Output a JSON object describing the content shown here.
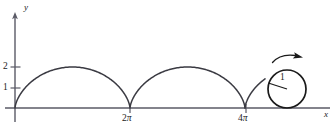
{
  "figure": {
    "kind": "cycloid-diagram",
    "colors": {
      "axis": "#5a5a66",
      "curve": "#3a3a42",
      "text": "#1a1a1a",
      "background": "#ffffff"
    },
    "axes": {
      "x_label": "x",
      "y_label": "y",
      "origin_px": {
        "x": 15,
        "y": 108
      },
      "x_axis_end_px": 330,
      "y_axis_top_px": 14
    },
    "y_ticks": [
      {
        "label": "1",
        "value": 1,
        "y_px": 88
      },
      {
        "label": "2",
        "value": 2,
        "y_px": 67
      }
    ],
    "x_ticks": [
      {
        "label_number": "2",
        "label_symbol": "π",
        "value": 6.2832,
        "x_px": 130
      },
      {
        "label_number": "4",
        "label_symbol": "π",
        "value": 12.5664,
        "x_px": 246
      }
    ],
    "circle": {
      "radius_label": "1",
      "center_px": {
        "x": 287,
        "y": 89
      },
      "radius_px": 19,
      "spoke_end_px": {
        "x": 268,
        "y": 83
      }
    },
    "rotation_arrow": {
      "label": "",
      "direction": "clockwise",
      "start_px": {
        "x": 274,
        "y": 60
      },
      "end_px": {
        "x": 303,
        "y": 56
      }
    }
  },
  "chart_data": {
    "type": "line",
    "title": "",
    "xlabel": "x",
    "ylabel": "y",
    "xlim": [
      0,
      16.5
    ],
    "ylim": [
      0,
      3.2
    ],
    "grid": false,
    "legend": null,
    "xticks": [
      6.2832,
      12.5664
    ],
    "xticklabels": [
      "2π",
      "4π"
    ],
    "yticks": [
      1,
      2
    ],
    "yticklabels": [
      "1",
      "2"
    ],
    "annotations": [
      {
        "text": "1",
        "kind": "radius-label",
        "x": 14.7,
        "y": 1.25
      },
      {
        "kind": "rolling-circle",
        "cx": 14.6,
        "cy": 1.0,
        "r": 1.0
      },
      {
        "kind": "rotation-arrow",
        "direction": "clockwise",
        "x": 14.6,
        "y": 2.6
      }
    ],
    "series": [
      {
        "name": "cycloid x = t - sin t, y = 1 - cos t",
        "parametric": true,
        "t_range": [
          0,
          12.5664
        ],
        "radius": 1,
        "arches": 2,
        "arch_peaks": [
          {
            "x": 3.1416,
            "y": 2
          },
          {
            "x": 9.4248,
            "y": 2
          }
        ],
        "cusps": [
          {
            "x": 0,
            "y": 0
          },
          {
            "x": 6.2832,
            "y": 0
          },
          {
            "x": 12.5664,
            "y": 0
          }
        ]
      }
    ]
  }
}
